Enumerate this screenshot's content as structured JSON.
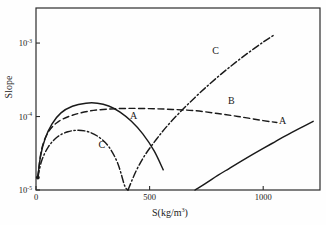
{
  "chart_data": {
    "type": "line",
    "title": "",
    "xlabel": "S(kg/m³)",
    "ylabel": "Slope",
    "xlabel_base": "S(kg/m",
    "xlabel_sup": "3",
    "xlabel_close": ")",
    "xlim": [
      0,
      1250
    ],
    "ylim": [
      1e-05,
      0.003
    ],
    "yscale": "log",
    "xscale": "linear",
    "grid": false,
    "legend_position": "inline-labels",
    "xticks": [
      {
        "value": 0,
        "label": "0"
      },
      {
        "value": 500,
        "label": "500"
      },
      {
        "value": 1000,
        "label": "1000"
      }
    ],
    "yticks": [
      {
        "value": 0.001,
        "mantissa": "10",
        "exponent": "-3"
      },
      {
        "value": 0.0001,
        "mantissa": "10",
        "exponent": "-4"
      },
      {
        "value": 1e-05,
        "mantissa": "10",
        "exponent": "-5"
      }
    ],
    "series": [
      {
        "name": "A-rising",
        "label": "A",
        "style": "solid",
        "comment": "Solid curve rising steeply on the right side of the plot",
        "points": [
          [
            700,
            1e-05
          ],
          [
            750,
            1.25e-05
          ],
          [
            800,
            1.58e-05
          ],
          [
            850,
            1.96e-05
          ],
          [
            900,
            2.43e-05
          ],
          [
            950,
            3e-05
          ],
          [
            1000,
            3.68e-05
          ],
          [
            1050,
            4.5e-05
          ],
          [
            1100,
            5.5e-05
          ],
          [
            1160,
            6.9e-05
          ],
          [
            1220,
            8.6e-05
          ]
        ]
      },
      {
        "name": "A-hump",
        "label": "A",
        "style": "solid",
        "comment": "Solid curve rising from origin to a peak near S=250 then falling to S=560",
        "points": [
          [
            8,
            1.48e-05
          ],
          [
            20,
            2.9e-05
          ],
          [
            40,
            5e-05
          ],
          [
            70,
            7.9e-05
          ],
          [
            110,
            0.000112
          ],
          [
            160,
            0.000138
          ],
          [
            220,
            0.000152
          ],
          [
            270,
            0.000152
          ],
          [
            320,
            0.000139
          ],
          [
            370,
            0.000115
          ],
          [
            420,
            8.6e-05
          ],
          [
            470,
            5.8e-05
          ],
          [
            520,
            3.4e-05
          ],
          [
            560,
            1.88e-05
          ]
        ]
      },
      {
        "name": "B",
        "label": "B",
        "style": "dashed",
        "comment": "Dashed curve rising from origin, broad flat maximum, slow decline to the right",
        "points": [
          [
            8,
            1.48e-05
          ],
          [
            25,
            3.6e-05
          ],
          [
            55,
            6.2e-05
          ],
          [
            100,
            8.6e-05
          ],
          [
            160,
            0.000104
          ],
          [
            230,
            0.000118
          ],
          [
            310,
            0.000126
          ],
          [
            400,
            0.000129
          ],
          [
            500,
            0.000128
          ],
          [
            600,
            0.000125
          ],
          [
            700,
            0.00012
          ],
          [
            800,
            0.00011
          ],
          [
            900,
            9.9e-05
          ],
          [
            1000,
            8.8e-05
          ],
          [
            1060,
            8.3e-05
          ]
        ]
      },
      {
        "name": "C-hump",
        "label": "C",
        "style": "dashdot",
        "comment": "Dash-dot low hump rising from origin, peaking near S=180, plunging to zero at S=400",
        "points": [
          [
            8,
            1.48e-05
          ],
          [
            25,
            2.5e-05
          ],
          [
            55,
            3.9e-05
          ],
          [
            95,
            5.3e-05
          ],
          [
            140,
            6.2e-05
          ],
          [
            185,
            6.5e-05
          ],
          [
            230,
            6.2e-05
          ],
          [
            275,
            5.3e-05
          ],
          [
            320,
            3.9e-05
          ],
          [
            360,
            2.3e-05
          ],
          [
            390,
            1.15e-05
          ],
          [
            405,
            1e-05
          ]
        ]
      },
      {
        "name": "C-rising",
        "label": "C",
        "style": "dashdot",
        "comment": "Dash-dot branch rising steeply from S=405 to the top of the frame",
        "points": [
          [
            405,
            1e-05
          ],
          [
            440,
            1.8e-05
          ],
          [
            480,
            3e-05
          ],
          [
            530,
            4.9e-05
          ],
          [
            580,
            7.6e-05
          ],
          [
            640,
            0.00012
          ],
          [
            700,
            0.000182
          ],
          [
            760,
            0.00027
          ],
          [
            820,
            0.00039
          ],
          [
            880,
            0.00055
          ],
          [
            940,
            0.00076
          ],
          [
            1000,
            0.00103
          ],
          [
            1050,
            0.0013
          ]
        ]
      }
    ],
    "annotations": [
      {
        "text": "C",
        "x": 790,
        "y": 0.00072,
        "name": "curve-label-c-upper"
      },
      {
        "text": "B",
        "x": 860,
        "y": 0.00015,
        "name": "curve-label-b"
      },
      {
        "text": "A",
        "x": 1085,
        "y": 7.8e-05,
        "name": "curve-label-a-right"
      },
      {
        "text": "A",
        "x": 430,
        "y": 9.3e-05,
        "name": "curve-label-a-hump"
      },
      {
        "text": "C",
        "x": 290,
        "y": 3.7e-05,
        "name": "curve-label-c-lower"
      }
    ]
  }
}
